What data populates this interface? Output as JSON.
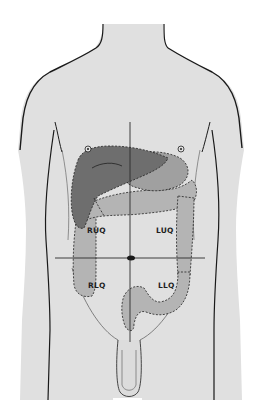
{
  "diagram": {
    "colors": {
      "background": "#ffffff",
      "skin": "#e0e0e0",
      "outline": "#1a1a1a",
      "liver": "#6e6e6e",
      "stomach": "#9a9a9a",
      "colon": "#b4b4b4",
      "crosshair": "#2a2a2a"
    },
    "quadrants": [
      {
        "id": "ruq",
        "label": "RUQ",
        "name": "Right upper quadrant"
      },
      {
        "id": "luq",
        "label": "LUQ",
        "name": "Left upper quadrant"
      },
      {
        "id": "rlq",
        "label": "RLQ",
        "name": "Right lower quadrant"
      },
      {
        "id": "llq",
        "label": "LLQ",
        "name": "Left lower quadrant"
      }
    ],
    "landmarks": [
      "nipple-right",
      "nipple-left",
      "umbilicus",
      "midline",
      "transumbilical-line"
    ],
    "organs": [
      "liver",
      "stomach",
      "transverse-colon",
      "ascending-colon",
      "descending-colon",
      "sigmoid-colon"
    ]
  }
}
